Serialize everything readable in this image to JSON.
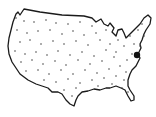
{
  "map": {
    "region": "United States (contiguous)",
    "outline_color": "#1a1a1a",
    "dot_color": "#444444",
    "highlight": {
      "label": "highlighted location",
      "x": 137,
      "y": 55,
      "r": 3.2,
      "color": "#111111"
    },
    "dots": [
      [
        16,
        18
      ],
      [
        24,
        21
      ],
      [
        34,
        22
      ],
      [
        46,
        20
      ],
      [
        56,
        23
      ],
      [
        68,
        24
      ],
      [
        80,
        22
      ],
      [
        92,
        26
      ],
      [
        17,
        30
      ],
      [
        27,
        33
      ],
      [
        38,
        31
      ],
      [
        50,
        30
      ],
      [
        62,
        34
      ],
      [
        73,
        31
      ],
      [
        84,
        35
      ],
      [
        96,
        33
      ],
      [
        20,
        42
      ],
      [
        30,
        40
      ],
      [
        41,
        44
      ],
      [
        53,
        41
      ],
      [
        64,
        44
      ],
      [
        76,
        41
      ],
      [
        88,
        45
      ],
      [
        100,
        40
      ],
      [
        15,
        51
      ],
      [
        25,
        54
      ],
      [
        36,
        52
      ],
      [
        47,
        55
      ],
      [
        58,
        51
      ],
      [
        70,
        55
      ],
      [
        82,
        52
      ],
      [
        94,
        56
      ],
      [
        106,
        50
      ],
      [
        21,
        62
      ],
      [
        32,
        60
      ],
      [
        43,
        64
      ],
      [
        55,
        61
      ],
      [
        66,
        65
      ],
      [
        78,
        60
      ],
      [
        90,
        64
      ],
      [
        102,
        61
      ],
      [
        114,
        57
      ],
      [
        26,
        71
      ],
      [
        38,
        70
      ],
      [
        49,
        74
      ],
      [
        61,
        70
      ],
      [
        73,
        74
      ],
      [
        85,
        70
      ],
      [
        97,
        73
      ],
      [
        109,
        69
      ],
      [
        120,
        66
      ],
      [
        44,
        80
      ],
      [
        56,
        82
      ],
      [
        68,
        79
      ],
      [
        80,
        83
      ],
      [
        92,
        80
      ],
      [
        104,
        78
      ],
      [
        116,
        76
      ],
      [
        126,
        72
      ],
      [
        64,
        90
      ],
      [
        76,
        88
      ],
      [
        98,
        86
      ],
      [
        112,
        84
      ],
      [
        124,
        80
      ],
      [
        118,
        40
      ],
      [
        124,
        46
      ],
      [
        130,
        36
      ],
      [
        134,
        44
      ],
      [
        138,
        30
      ],
      [
        142,
        24
      ],
      [
        132,
        54
      ],
      [
        127,
        60
      ],
      [
        144,
        36
      ],
      [
        140,
        46
      ],
      [
        110,
        44
      ],
      [
        106,
        30
      ],
      [
        116,
        52
      ],
      [
        122,
        88
      ],
      [
        128,
        92
      ],
      [
        72,
        96
      ]
    ]
  }
}
